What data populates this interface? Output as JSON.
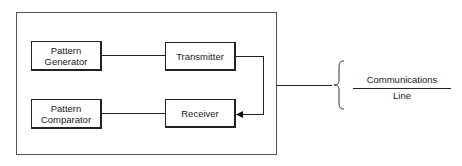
{
  "diagram": {
    "system_box": {},
    "blocks": {
      "pattern_generator": {
        "line1": "Pattern",
        "line2": "Generator"
      },
      "transmitter": {
        "label": "Transmitter"
      },
      "pattern_comparator": {
        "line1": "Pattern",
        "line2": "Comparator"
      },
      "receiver": {
        "label": "Receiver"
      }
    },
    "communications_line": {
      "line1": "Communications",
      "line2": "Line"
    }
  }
}
